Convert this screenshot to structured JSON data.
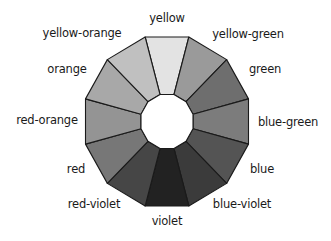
{
  "diagram": {
    "type": "color-wheel",
    "center": [
      167,
      121.5
    ],
    "outer_apothem": [
      81.5,
      84.5
    ],
    "inner_apothem": [
      26,
      27
    ],
    "stroke": "#1a1a1a",
    "segments": [
      {
        "name": "yellow",
        "fill": "#e3e3e3",
        "label_pos": [
          167,
          19
        ]
      },
      {
        "name": "yellow-green",
        "fill": "#9a9a9a",
        "label_pos": [
          248,
          35
        ]
      },
      {
        "name": "green",
        "fill": "#6e6e6e",
        "label_pos": [
          265,
          70
        ]
      },
      {
        "name": "blue-green",
        "fill": "#7c7c7c",
        "label_pos": [
          288,
          123
        ]
      },
      {
        "name": "blue",
        "fill": "#545454",
        "label_pos": [
          262,
          170
        ]
      },
      {
        "name": "blue-violet",
        "fill": "#3b3b3b",
        "label_pos": [
          242,
          205
        ]
      },
      {
        "name": "violet",
        "fill": "#222222",
        "label_pos": [
          167,
          222
        ]
      },
      {
        "name": "red-violet",
        "fill": "#464646",
        "label_pos": [
          94,
          205
        ]
      },
      {
        "name": "red",
        "fill": "#777777",
        "label_pos": [
          76,
          170
        ]
      },
      {
        "name": "red-orange",
        "fill": "#949494",
        "label_pos": [
          47,
          121
        ]
      },
      {
        "name": "orange",
        "fill": "#a8a8a8",
        "label_pos": [
          67,
          70
        ]
      },
      {
        "name": "yellow-orange",
        "fill": "#c0c0c0",
        "label_pos": [
          82,
          34
        ]
      }
    ]
  }
}
